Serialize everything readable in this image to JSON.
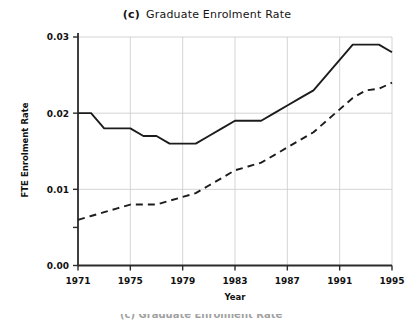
{
  "figure": {
    "panel_letter": "(c)",
    "title": "Graduate Enrolment Rate",
    "background_color": "#ffffff",
    "line_color": "#1c1c1c",
    "grid_color": "#c9c9c9",
    "clipped_caption": "(c) Graduate Enrolment Rate"
  },
  "chart_data": {
    "type": "line",
    "title": "(c)  Graduate Enrolment Rate",
    "xlabel": "Year",
    "ylabel": "FTE Enrolment Rate",
    "xlim": [
      1971,
      1995
    ],
    "ylim": [
      0.0,
      0.03
    ],
    "xticks": [
      1971,
      1975,
      1979,
      1983,
      1987,
      1991,
      1995
    ],
    "xtick_labels": [
      "1971",
      "1975",
      "1979",
      "1983",
      "1987",
      "1991",
      "1995"
    ],
    "yticks": [
      0.0,
      0.01,
      0.02,
      0.03
    ],
    "ytick_labels": [
      "0.00",
      "0.01",
      "0.02",
      "0.03"
    ],
    "grid": true,
    "legend": null,
    "x": [
      1971,
      1972,
      1973,
      1974,
      1975,
      1976,
      1977,
      1978,
      1979,
      1980,
      1981,
      1982,
      1983,
      1984,
      1985,
      1986,
      1987,
      1988,
      1989,
      1990,
      1991,
      1992,
      1993,
      1994,
      1995
    ],
    "series": [
      {
        "name": "solid-series",
        "style": "solid",
        "values": [
          0.02,
          0.02,
          0.018,
          0.018,
          0.018,
          0.017,
          0.017,
          0.016,
          0.016,
          0.016,
          0.017,
          0.018,
          0.019,
          0.019,
          0.019,
          0.02,
          0.021,
          0.022,
          0.023,
          0.025,
          0.027,
          0.029,
          0.029,
          0.029,
          0.028
        ]
      },
      {
        "name": "dashed-series",
        "style": "dashed",
        "values": [
          0.006,
          0.0065,
          0.007,
          0.0075,
          0.008,
          0.008,
          0.008,
          0.0085,
          0.009,
          0.0095,
          0.0105,
          0.0115,
          0.0125,
          0.013,
          0.0135,
          0.0145,
          0.0155,
          0.0165,
          0.0175,
          0.019,
          0.0205,
          0.022,
          0.023,
          0.0232,
          0.024
        ]
      }
    ]
  }
}
